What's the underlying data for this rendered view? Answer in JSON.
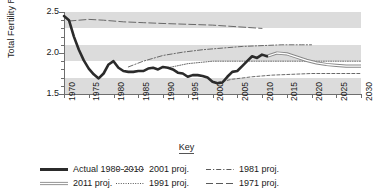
{
  "chart_data": {
    "type": "line",
    "title": "",
    "xlabel": "",
    "ylabel": "Total Fertility Rate",
    "xlim": [
      1970,
      2030
    ],
    "ylim": [
      1.5,
      2.5
    ],
    "ytick_labels": [
      "2.5",
      "2.0",
      "1.5"
    ],
    "ytick_values": [
      2.5,
      2.0,
      1.5
    ],
    "yminor_step": 0.1,
    "xtick_labels": [
      "1970",
      "1975",
      "1980",
      "1985",
      "1990",
      "1995",
      "2000",
      "2005",
      "2010",
      "2015",
      "2020",
      "2025",
      "2030"
    ],
    "xtick_values": [
      1970,
      1975,
      1980,
      1985,
      1990,
      1995,
      2000,
      2005,
      2010,
      2015,
      2020,
      2025,
      2030
    ],
    "grid": "horizontal-bands",
    "band_ranges": [
      [
        2.3,
        2.5
      ],
      [
        1.9,
        2.1
      ],
      [
        1.5,
        1.7
      ]
    ],
    "legend_position": "bottom",
    "legend_title": "Key",
    "series": [
      {
        "name": "Actual 1980-2010",
        "style": "solid-thick",
        "color": "#2b2b2b",
        "x": [
          1970,
          1971,
          1972,
          1973,
          1974,
          1975,
          1976,
          1977,
          1978,
          1979,
          1980,
          1981,
          1982,
          1983,
          1984,
          1985,
          1986,
          1987,
          1988,
          1989,
          1990,
          1991,
          1992,
          1993,
          1994,
          1995,
          1996,
          1997,
          1998,
          1999,
          2000,
          2001,
          2002,
          2003,
          2004,
          2005,
          2006,
          2007,
          2008,
          2009,
          2010,
          2011
        ],
        "values": [
          2.45,
          2.4,
          2.2,
          2.04,
          1.91,
          1.81,
          1.74,
          1.69,
          1.75,
          1.86,
          1.9,
          1.82,
          1.78,
          1.77,
          1.77,
          1.78,
          1.78,
          1.81,
          1.82,
          1.8,
          1.83,
          1.82,
          1.8,
          1.76,
          1.75,
          1.71,
          1.73,
          1.73,
          1.72,
          1.7,
          1.65,
          1.63,
          1.64,
          1.71,
          1.77,
          1.78,
          1.84,
          1.9,
          1.96,
          1.94,
          1.98,
          1.96
        ]
      },
      {
        "name": "2011 proj.",
        "style": "double-hollow",
        "color": "#888888",
        "x": [
          2011,
          2013,
          2015,
          2017,
          2019,
          2021,
          2023,
          2025,
          2027,
          2030
        ],
        "values": [
          1.96,
          2.0,
          1.99,
          1.95,
          1.91,
          1.88,
          1.86,
          1.85,
          1.84,
          1.84
        ]
      },
      {
        "name": "2001 proj.",
        "style": "dashed",
        "color": "#5a5a5a",
        "x": [
          2001,
          2004,
          2008,
          2012,
          2016,
          2020,
          2024,
          2027,
          2030
        ],
        "values": [
          1.64,
          1.68,
          1.71,
          1.73,
          1.74,
          1.75,
          1.75,
          1.75,
          1.75
        ]
      },
      {
        "name": "1991 proj.",
        "style": "dotted",
        "color": "#5a5a5a",
        "x": [
          1991,
          1995,
          2000,
          2005,
          2010,
          2015,
          2020,
          2025,
          2030
        ],
        "values": [
          1.82,
          1.87,
          1.9,
          1.9,
          1.9,
          1.9,
          1.9,
          1.9,
          1.9
        ]
      },
      {
        "name": "1981 proj.",
        "style": "dash-dot",
        "color": "#5a5a5a",
        "x": [
          1983,
          1986,
          1990,
          1994,
          1998,
          2002,
          2006,
          2010,
          2014,
          2018,
          2020
        ],
        "values": [
          1.83,
          1.9,
          1.97,
          2.01,
          2.04,
          2.06,
          2.08,
          2.09,
          2.1,
          2.1,
          2.1
        ]
      },
      {
        "name": "1971 proj.",
        "style": "long-dash",
        "color": "#5a5a5a",
        "x": [
          1971,
          1973,
          1975,
          1978,
          1982,
          1986,
          1990,
          1995,
          2000,
          2005,
          2010
        ],
        "values": [
          2.39,
          2.4,
          2.41,
          2.4,
          2.38,
          2.37,
          2.36,
          2.35,
          2.34,
          2.32,
          2.3
        ]
      }
    ]
  },
  "legend": {
    "title": "Key",
    "items": [
      {
        "label": "Actual 1980-2010",
        "swatch": "solid-thick-swatch"
      },
      {
        "label": "2001 proj.",
        "swatch": "dashed-swatch"
      },
      {
        "label": "1981 proj.",
        "swatch": "dash-dot-swatch"
      },
      {
        "label": "2011 proj.",
        "swatch": "double-hollow-swatch"
      },
      {
        "label": "1991 proj.",
        "swatch": "dotted-swatch"
      },
      {
        "label": "1971 proj.",
        "swatch": "long-dash-swatch"
      }
    ]
  },
  "colors": {
    "band": "#dcdcdc",
    "axis": "#6e6e6e",
    "actual": "#2b2b2b",
    "projection": "#5a5a5a",
    "proj2011": "#888888",
    "background": "#ffffff"
  }
}
